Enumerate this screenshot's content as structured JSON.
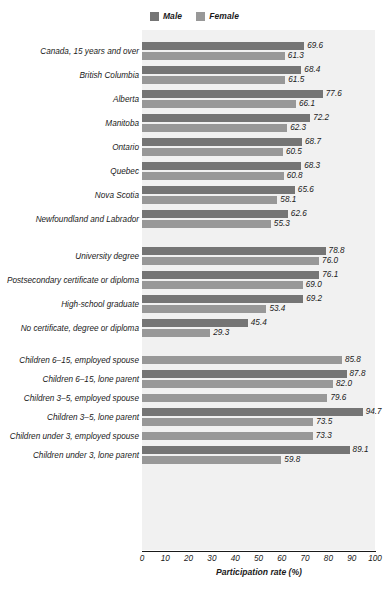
{
  "legend": {
    "entries": [
      {
        "label": "Male",
        "color": "#757575",
        "icon": "square-swatch-icon"
      },
      {
        "label": "Female",
        "color": "#989898",
        "icon": "square-swatch-icon"
      }
    ]
  },
  "axis": {
    "title": "Participation rate (%)",
    "ticks": [
      "0",
      "10",
      "20",
      "30",
      "40",
      "50",
      "60",
      "70",
      "80",
      "90",
      "100"
    ]
  },
  "chart_data": {
    "type": "bar",
    "orientation": "horizontal",
    "title": "",
    "subtitle": "",
    "xlabel": "Participation rate (%)",
    "ylabel": "",
    "xlim": [
      0,
      100
    ],
    "xticks": [
      0,
      10,
      20,
      30,
      40,
      50,
      60,
      70,
      80,
      90,
      100
    ],
    "grid": false,
    "legend": [
      "Male",
      "Female"
    ],
    "legend_position": "top-center",
    "series": [
      {
        "name": "Male",
        "color": "#757575"
      },
      {
        "name": "Female",
        "color": "#989898"
      }
    ],
    "groups": [
      {
        "name": "national-and-provinces",
        "rows": [
          {
            "category": "Canada, 15 years and over",
            "Male": 69.6,
            "Female": 61.3
          },
          {
            "category": "British Columbia",
            "Male": 68.4,
            "Female": 61.5
          },
          {
            "category": "Alberta",
            "Male": 77.6,
            "Female": 66.1
          },
          {
            "category": "Manitoba",
            "Male": 72.2,
            "Female": 62.3
          },
          {
            "category": "Ontario",
            "Male": 68.7,
            "Female": 60.5
          },
          {
            "category": "Quebec",
            "Male": 68.3,
            "Female": 60.8
          },
          {
            "category": "Nova Scotia",
            "Male": 65.6,
            "Female": 58.1
          },
          {
            "category": "Newfoundland and Labrador",
            "Male": 62.6,
            "Female": 55.3
          }
        ]
      },
      {
        "name": "education",
        "rows": [
          {
            "category": "University degree",
            "Male": 78.8,
            "Female": 76.0
          },
          {
            "category": "Postsecondary certificate or diploma",
            "Male": 76.1,
            "Female": 69.0
          },
          {
            "category": "High-school graduate",
            "Male": 69.2,
            "Female": 53.4
          },
          {
            "category": "No certificate, degree or diploma",
            "Male": 45.4,
            "Female": 29.3
          }
        ]
      },
      {
        "name": "family-type",
        "rows": [
          {
            "category": "Children 6–15, employed spouse",
            "Male": null,
            "Female": 85.8
          },
          {
            "category": "Children 6–15, lone parent",
            "Male": 87.8,
            "Female": 82.0
          },
          {
            "category": "Children 3–5, employed spouse",
            "Male": null,
            "Female": 79.6
          },
          {
            "category": "Children 3–5, lone parent",
            "Male": 94.7,
            "Female": 73.5
          },
          {
            "category": "Children under 3, employed spouse",
            "Male": null,
            "Female": 73.3
          },
          {
            "category": "Children under 3, lone parent",
            "Male": 89.1,
            "Female": 59.8
          }
        ]
      }
    ]
  }
}
